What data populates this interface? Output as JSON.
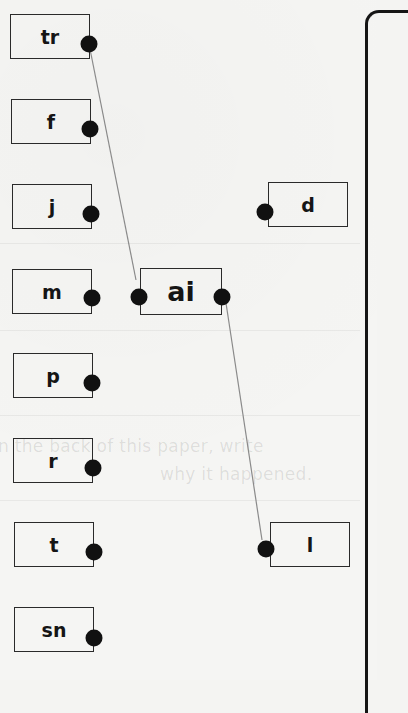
{
  "worksheet": {
    "left_column": [
      {
        "label": "tr",
        "x": 10,
        "y": 14
      },
      {
        "label": "f",
        "x": 11,
        "y": 99
      },
      {
        "label": "j",
        "x": 12,
        "y": 184
      },
      {
        "label": "m",
        "x": 12,
        "y": 269
      },
      {
        "label": "p",
        "x": 13,
        "y": 353
      },
      {
        "label": "r",
        "x": 13,
        "y": 438
      },
      {
        "label": "t",
        "x": 14,
        "y": 522
      },
      {
        "label": "sn",
        "x": 14,
        "y": 607
      }
    ],
    "center": {
      "label": "ai",
      "x": 140,
      "y": 268
    },
    "right_column": [
      {
        "label": "d",
        "x": 268,
        "y": 182
      },
      {
        "label": "l",
        "x": 270,
        "y": 522
      }
    ],
    "connections": [
      {
        "from": "tr",
        "to": "ai",
        "x1": 89,
        "y1": 44,
        "x2": 136,
        "y2": 280
      },
      {
        "from": "ai",
        "to": "l",
        "x1": 226,
        "y1": 303,
        "x2": 262,
        "y2": 540
      }
    ],
    "bleed_through_text": [
      "n the back of this paper, write",
      "why it happened."
    ],
    "colors": {
      "ink": "#151515",
      "line": "#8a8a8a",
      "paper": "#f5f5f3"
    }
  }
}
